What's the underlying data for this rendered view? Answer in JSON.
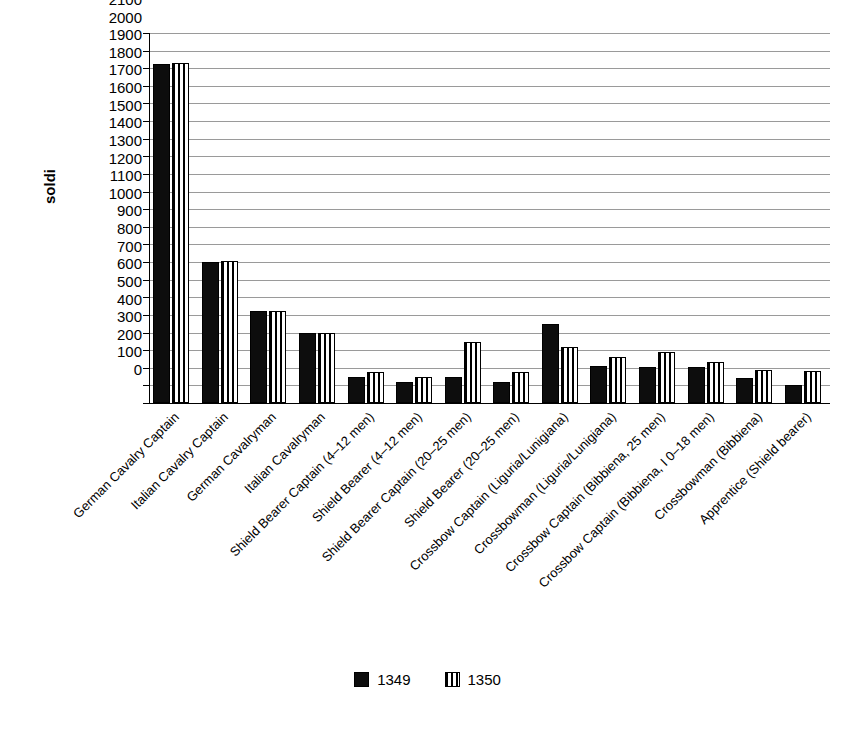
{
  "chart_data": {
    "type": "bar",
    "title": "",
    "xlabel": "",
    "ylabel": "soldi",
    "ylim": [
      0,
      2100
    ],
    "ytick_step": 100,
    "grid": true,
    "legend_position": "bottom-center",
    "categories": [
      "German Cavalry Captain",
      "Italian Cavalry Captain",
      "German Cavalryman",
      "Italian Cavalryman",
      "Shield Bearer Captain (4–12 men)",
      "Shield Bearer (4–12 men)",
      "Shield Bearer Captain (20–25 men)",
      "Shield Bearer (20–25 men)",
      "Crossbow Captain (Liguria/Lunigiana)",
      "Crossbowman (Liguria/Lunigiana)",
      "Crossbow Captain (Bibbiena, 25 men)",
      "Crossbow Captain (Bibbiena, I 0–18 men)",
      "Crossbowman (Bibbiena)",
      "Apprentice (Shield bearer)"
    ],
    "series": [
      {
        "name": "1349",
        "pattern": "solid",
        "values": [
          1925,
          800,
          520,
          400,
          150,
          120,
          150,
          120,
          450,
          210,
          205,
          205,
          140,
          105
        ]
      },
      {
        "name": "1350",
        "pattern": "vertical-stripes",
        "values": [
          1930,
          805,
          525,
          400,
          175,
          145,
          345,
          175,
          320,
          260,
          290,
          235,
          185,
          180
        ]
      }
    ],
    "ytick_labels": [
      "0",
      "100",
      "200",
      "300",
      "400",
      "500",
      "600",
      "700",
      "800",
      "900",
      "1000",
      "1100",
      "1200",
      "1300",
      "1400",
      "1500",
      "1600",
      "1700",
      "1800",
      "1900",
      "2000",
      "2100"
    ],
    "colors": {
      "series_1349": "#0d0d0d",
      "series_1350_stripe": "#000000",
      "series_1350_background": "#ffffff",
      "gridline": "#9a9a9a",
      "axis": "#000000",
      "background": "#ffffff"
    }
  },
  "legend": {
    "items": [
      {
        "label": "1349",
        "pattern": "solid"
      },
      {
        "label": "1350",
        "pattern": "vertical-stripes"
      }
    ]
  }
}
